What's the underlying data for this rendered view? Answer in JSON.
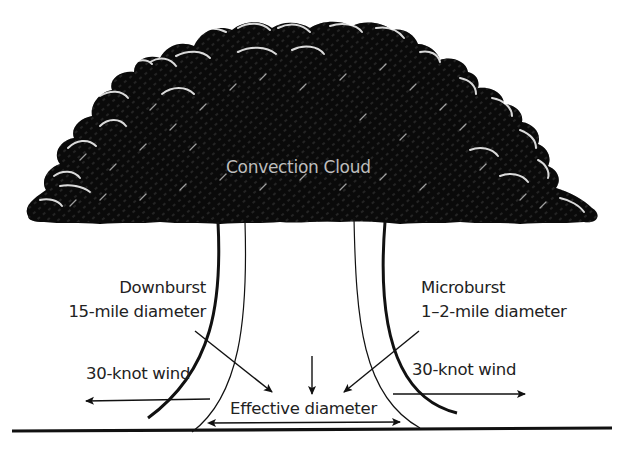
{
  "diagram": {
    "cloud": {
      "label": "Convection Cloud",
      "fill": "#0a0a0a",
      "text_color": "#bdbdbd"
    },
    "downburst": {
      "name": "Downburst",
      "size": "15-mile diameter"
    },
    "microburst": {
      "name": "Microburst",
      "size": "1–2-mile diameter"
    },
    "wind_left": {
      "label": "30-knot wind"
    },
    "wind_right": {
      "label": "30-knot wind"
    },
    "effective": {
      "label": "Effective diameter"
    },
    "colors": {
      "ink": "#111111",
      "background": "#ffffff"
    }
  }
}
